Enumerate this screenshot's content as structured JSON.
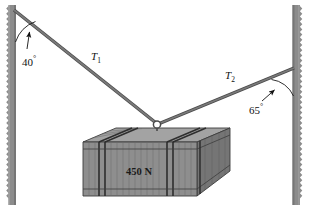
{
  "figure": {
    "background_color": "#ffffff",
    "width": 311,
    "height": 212
  },
  "labels": {
    "angle_left": "40",
    "angle_left_unit": "°",
    "angle_right": "65",
    "angle_right_unit": "°",
    "tension_left": "T",
    "tension_left_sub": "1",
    "tension_right": "T",
    "tension_right_sub": "2",
    "weight": "450 N"
  },
  "colors": {
    "wall": "#8c8c8c",
    "wall_edge": "#6e6e6e",
    "cable": "#6b6b6b",
    "cable_outline": "#4a4a4a",
    "crate_front": "#8e8e8e",
    "crate_top": "#a6a6a6",
    "crate_side": "#757575",
    "crate_line": "#3c3c3c",
    "annotation": "#111111",
    "ring": "#5a5a5a"
  },
  "geometry": {
    "left_wall_x": 12,
    "right_wall_x": 296,
    "ring_x": 157,
    "ring_y": 124,
    "cable_left_anchor_x": 14,
    "cable_left_anchor_y": 10,
    "cable_right_anchor_x": 294,
    "cable_right_anchor_y": 68
  },
  "parts": {
    "left_wall": "left-wall",
    "right_wall": "right-wall",
    "cable_left": "cable-t1",
    "cable_right": "cable-t2",
    "ring": "connector-ring",
    "crate": "crate"
  }
}
